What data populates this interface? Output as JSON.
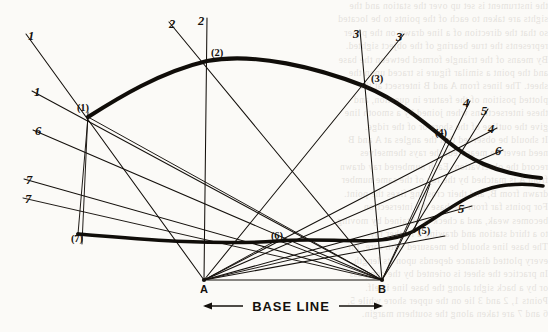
{
  "figure": {
    "base_label": "BASE LINE",
    "ink_color": "#14100c",
    "paper_color": "#fbfaf7",
    "station_points": [
      {
        "id": "A",
        "label": "A",
        "x": 204,
        "y": 280
      },
      {
        "id": "B",
        "label": "B",
        "x": 382,
        "y": 280
      }
    ],
    "plotted_nodes": [
      {
        "id": "n1",
        "label": "(1)",
        "x": 88,
        "y": 117
      },
      {
        "id": "n2",
        "label": "(2)",
        "x": 207,
        "y": 60
      },
      {
        "id": "n3",
        "label": "(3)",
        "x": 364,
        "y": 85
      },
      {
        "id": "n4",
        "label": "(4)",
        "x": 447,
        "y": 139
      },
      {
        "id": "n5",
        "label": "(5)",
        "x": 414,
        "y": 231
      },
      {
        "id": "n6",
        "label": "(6)",
        "x": 277,
        "y": 240
      },
      {
        "id": "n7",
        "label": "(7)",
        "x": 78,
        "y": 234
      }
    ],
    "ray_labels": [
      {
        "id": "r1a",
        "label": "1",
        "x": 31,
        "y": 40
      },
      {
        "id": "r1b",
        "label": "1",
        "x": 37,
        "y": 96
      },
      {
        "id": "r2a",
        "label": "2",
        "x": 172,
        "y": 28
      },
      {
        "id": "r2b",
        "label": "2",
        "x": 201,
        "y": 25
      },
      {
        "id": "r3a",
        "label": "3",
        "x": 356,
        "y": 38
      },
      {
        "id": "r3b",
        "label": "3",
        "x": 399,
        "y": 41
      },
      {
        "id": "r4a",
        "label": "4",
        "x": 466,
        "y": 107
      },
      {
        "id": "r5a",
        "label": "5",
        "x": 484,
        "y": 115
      },
      {
        "id": "r4b",
        "label": "4",
        "x": 491,
        "y": 133
      },
      {
        "id": "r6a",
        "label": "6",
        "x": 498,
        "y": 155
      },
      {
        "id": "r5b",
        "label": "5",
        "x": 461,
        "y": 213
      },
      {
        "id": "r6b",
        "label": "6",
        "x": 38,
        "y": 135
      },
      {
        "id": "r7a",
        "label": "7",
        "x": 29,
        "y": 184
      },
      {
        "id": "r7b",
        "label": "7",
        "x": 28,
        "y": 203
      }
    ],
    "legend_note": ""
  },
  "ghost_text": {
    "lines": [
      "the instrument is set up over the station and the",
      "sights are taken to each of the points to be located",
      "so that the direction of a line drawn on the paper",
      "represents the true bearing of the object sighted.",
      "By means of the triangle formed between the base",
      "and the point a similar figure is traced upon the",
      "sheet. The lines from A and B intersect at the",
      "plotted position of the feature in question, and",
      "these intersections when joined by a smooth line",
      "give the outline of the shore or of the ridge.",
      "It should be observed that the angles at A and B",
      "need never be measured; the rays themselves",
      "record the observation. Each numbered ray drawn",
      "from A is matched by the ray of the same number",
      "drawn from B, and their crossing fixes the point.",
      "For points far from the base the intersection",
      "becomes weak, and a check is obtained by moving",
      "to a third station and drawing a further ray.",
      "The base line should be measured with care, for",
      "every plotted distance depends upon its length.",
      "In practice the sheet is oriented by the compass",
      "or by a back sight along the base line itself.",
      "Points 1, 2 and 3 lie on the upper shore while 5,",
      "6 and 7 are taken along the southern margin."
    ]
  }
}
